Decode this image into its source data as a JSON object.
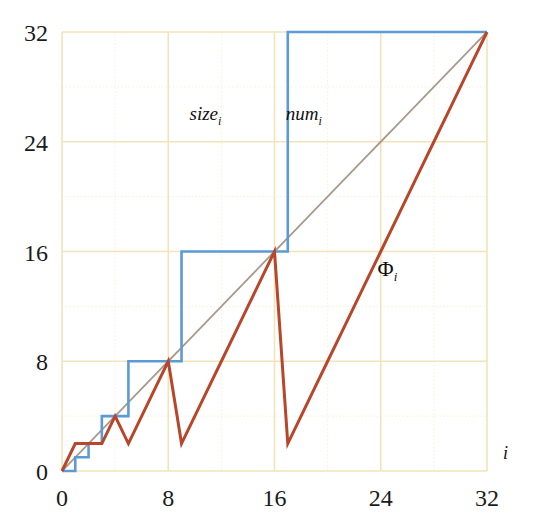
{
  "chart_data": {
    "type": "line",
    "title": "",
    "subtitle": "",
    "xlabel": "i",
    "ylabel": "",
    "xlim": [
      0,
      32
    ],
    "ylim": [
      0,
      32
    ],
    "grid": true,
    "grid_color": "#f2e3b8",
    "grid_minor": true,
    "legend_position": "inline-annotations",
    "background": "#ffffff",
    "x_ticks": [
      0,
      8,
      16,
      24,
      32
    ],
    "x_tick_labels": [
      "0",
      "8",
      "16",
      "24",
      "32"
    ],
    "x_minor_ticks": [
      4,
      12,
      20,
      28
    ],
    "y_ticks": [
      0,
      8,
      16,
      24,
      32
    ],
    "y_tick_labels": [
      "0",
      "8",
      "16",
      "24",
      "32"
    ],
    "y_minor_ticks": [
      4,
      12,
      20,
      28
    ],
    "x": [
      0,
      1,
      2,
      3,
      4,
      5,
      6,
      7,
      8,
      9,
      10,
      11,
      12,
      13,
      14,
      15,
      16,
      17,
      18,
      19,
      20,
      21,
      22,
      23,
      24,
      25,
      26,
      27,
      28,
      29,
      30,
      31,
      32
    ],
    "series": [
      {
        "name": "size_i",
        "label": "size",
        "label_subscript": "i",
        "color": "#5b9bd5",
        "width": 2.6,
        "style": "step",
        "label_x": 10.8,
        "label_y": 25.6,
        "values": [
          0,
          1,
          2,
          4,
          4,
          8,
          8,
          8,
          8,
          16,
          16,
          16,
          16,
          16,
          16,
          16,
          16,
          32,
          32,
          32,
          32,
          32,
          32,
          32,
          32,
          32,
          32,
          32,
          32,
          32,
          32,
          32,
          32
        ]
      },
      {
        "name": "num_i",
        "label": "num",
        "label_subscript": "i",
        "color": "#a89a8c",
        "width": 1.8,
        "style": "linear",
        "label_x": 18.2,
        "label_y": 25.6,
        "values": [
          0,
          1,
          2,
          3,
          4,
          5,
          6,
          7,
          8,
          9,
          10,
          11,
          12,
          13,
          14,
          15,
          16,
          17,
          18,
          19,
          20,
          21,
          22,
          23,
          24,
          25,
          26,
          27,
          28,
          29,
          30,
          31,
          32
        ]
      },
      {
        "name": "Phi_i",
        "label": "Φ",
        "label_subscript": "i",
        "color": "#b8462a",
        "width": 3.0,
        "style": "linear",
        "label_x": 24.5,
        "label_y": 14.2,
        "values": [
          0,
          2,
          2,
          2,
          4,
          2,
          4,
          6,
          8,
          2,
          4,
          6,
          8,
          10,
          12,
          14,
          16,
          2,
          4,
          6,
          8,
          10,
          12,
          14,
          16,
          18,
          20,
          22,
          24,
          26,
          28,
          30,
          32
        ]
      }
    ],
    "annotations": [
      {
        "text": "i",
        "x": 33.4,
        "y": 0.9,
        "role": "x-axis-name"
      }
    ]
  },
  "geometry": {
    "plot_left": 62,
    "plot_right": 487,
    "plot_top": 32,
    "plot_bottom": 471
  }
}
